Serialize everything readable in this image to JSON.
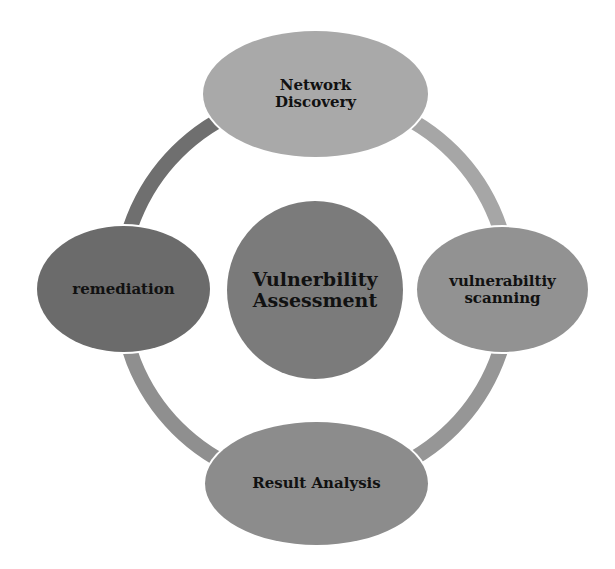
{
  "diagram": {
    "type": "cycle",
    "center": {
      "label_line1": "Vulnerbility",
      "label_line2": "Assessment",
      "color": "#7b7b7b"
    },
    "nodes": [
      {
        "id": "network-discovery",
        "position": "top",
        "label_line1": "Network",
        "label_line2": "Discovery",
        "color": "#a9a9a9"
      },
      {
        "id": "vulnerability-scanning",
        "position": "right",
        "label_line1": "vulnerabiltiy",
        "label_line2": "scanning",
        "color": "#929292"
      },
      {
        "id": "result-analysis",
        "position": "bottom",
        "label_line1": "Result Analysis",
        "color": "#8c8c8c"
      },
      {
        "id": "remediation",
        "position": "left",
        "label_line1": "remediation",
        "color": "#6b6b6b"
      }
    ],
    "ring": {
      "arc_colors": {
        "top_right": "#a6a6a6",
        "bottom_right": "#969696",
        "bottom_left": "#8f8f8f",
        "top_left": "#6f6f6f"
      }
    }
  }
}
